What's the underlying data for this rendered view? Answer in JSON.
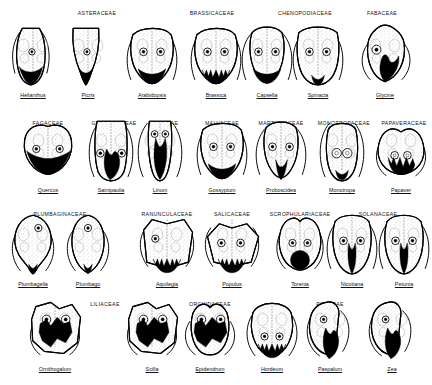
{
  "figure": {
    "ink_color": "#000000",
    "background": "#ffffff",
    "stipple_color": "#9a9a9a",
    "rows": [
      {
        "id": "row-1",
        "families": [
          {
            "name": "ASTERACEAE",
            "cx": 97,
            "y": 10
          },
          {
            "name": "BRASSICACEAE",
            "cx": 212,
            "y": 10
          },
          {
            "name": "CHENOPODIACEAE",
            "cx": 305,
            "y": 10
          },
          {
            "name": "FABACEAE",
            "cx": 382,
            "y": 10
          }
        ],
        "taxa": [
          {
            "genus": "Helianthus",
            "cx": 33,
            "label_y": 92,
            "shape": "slender-erect",
            "embryo": "basal-wedge"
          },
          {
            "genus": "Picris",
            "cx": 88,
            "label_y": 92,
            "shape": "slender-v",
            "embryo": "basal-narrow"
          },
          {
            "genus": "Arabidopsis",
            "cx": 152,
            "label_y": 92,
            "shape": "broad-lobed",
            "embryo": "basal-broad"
          },
          {
            "genus": "Brassica",
            "cx": 216,
            "label_y": 92,
            "shape": "broad-lobed",
            "embryo": "basal-fringe"
          },
          {
            "genus": "Capsella",
            "cx": 267,
            "label_y": 92,
            "shape": "narrow-lobed",
            "embryo": "basal-broad"
          },
          {
            "genus": "Spinacia",
            "cx": 318,
            "label_y": 92,
            "shape": "broad-square",
            "embryo": "basal-small"
          },
          {
            "genus": "Glycine",
            "cx": 385,
            "label_y": 92,
            "shape": "rounded-ovate",
            "embryo": "basal-lobe"
          }
        ]
      },
      {
        "id": "row-2",
        "families": [
          {
            "name": "FAGACEAE",
            "cx": 48,
            "y": 120
          },
          {
            "name": "GESNERIACEAE",
            "cx": 114,
            "y": 120
          },
          {
            "name": "LINACEAE",
            "cx": 164,
            "y": 120
          },
          {
            "name": "MALVACEAE",
            "cx": 222,
            "y": 120
          },
          {
            "name": "MARTYNIACEAE",
            "cx": 281,
            "y": 120
          },
          {
            "name": "MONOTROPACEAE",
            "cx": 344,
            "y": 120
          },
          {
            "name": "PAPAVERACEAE",
            "cx": 404,
            "y": 120
          }
        ],
        "taxa": [
          {
            "genus": "Quercus",
            "cx": 48,
            "label_y": 187,
            "shape": "wide-heart",
            "embryo": "basal-wide"
          },
          {
            "genus": "Saintpaulia",
            "cx": 111,
            "label_y": 187,
            "shape": "tall-column",
            "embryo": "lateral-mass"
          },
          {
            "genus": "Linum",
            "cx": 160,
            "label_y": 187,
            "shape": "tall-narrow",
            "embryo": "axial-long"
          },
          {
            "genus": "Gossypium",
            "cx": 222,
            "label_y": 187,
            "shape": "broad-lobed",
            "embryo": "basal-broad"
          },
          {
            "genus": "Proboscidea",
            "cx": 281,
            "label_y": 187,
            "shape": "narrow-lobed",
            "embryo": "basal-spike"
          },
          {
            "genus": "Monotropa",
            "cx": 342,
            "label_y": 187,
            "shape": "tall-oval",
            "embryo": "basal-small"
          },
          {
            "genus": "Papaver",
            "cx": 401,
            "label_y": 187,
            "shape": "lobed-broad",
            "embryo": "basal-ragged"
          }
        ]
      },
      {
        "id": "row-3",
        "families": [
          {
            "name": "PLUMBAGINACEAE",
            "cx": 60,
            "y": 211
          },
          {
            "name": "RANUNCULACEAE",
            "cx": 167,
            "y": 211
          },
          {
            "name": "SALICACEAE",
            "cx": 232,
            "y": 211
          },
          {
            "name": "SCROPHULARIACEAE",
            "cx": 300,
            "y": 211
          },
          {
            "name": "SOLANACEAE",
            "cx": 378,
            "y": 211
          }
        ],
        "taxa": [
          {
            "genus": "Plumbagella",
            "cx": 33,
            "label_y": 281,
            "shape": "pear-drop",
            "embryo": "basal-tip"
          },
          {
            "genus": "Plumbago",
            "cx": 88,
            "label_y": 281,
            "shape": "oval-upright",
            "embryo": "basal-tip"
          },
          {
            "genus": "Aquilegia",
            "cx": 167,
            "label_y": 281,
            "shape": "angular-wide",
            "embryo": "basal-fringe"
          },
          {
            "genus": "Populus",
            "cx": 232,
            "label_y": 281,
            "shape": "flat-wide",
            "embryo": "basal-fringe"
          },
          {
            "genus": "Torenia",
            "cx": 300,
            "label_y": 281,
            "shape": "round-lobed",
            "embryo": "basal-disc"
          },
          {
            "genus": "Nicotiana",
            "cx": 352,
            "label_y": 281,
            "shape": "tall-lobed",
            "embryo": "axial-spike"
          },
          {
            "genus": "Petunia",
            "cx": 404,
            "label_y": 281,
            "shape": "tall-lobed",
            "embryo": "axial-spike"
          }
        ]
      },
      {
        "id": "row-4",
        "families": [
          {
            "name": "LILIACEAE",
            "cx": 105,
            "y": 301
          },
          {
            "name": "ORCHIDACEAE",
            "cx": 210,
            "y": 301
          },
          {
            "name": "POACEAE",
            "cx": 330,
            "y": 301
          }
        ],
        "taxa": [
          {
            "genus": "Ornithogalum",
            "cx": 55,
            "label_y": 366,
            "shape": "blocky-lobed",
            "embryo": "central-mass"
          },
          {
            "genus": "Scilla",
            "cx": 152,
            "label_y": 366,
            "shape": "blocky-lobed",
            "embryo": "central-mass"
          },
          {
            "genus": "Epidendrum",
            "cx": 210,
            "label_y": 366,
            "shape": "small-lobed",
            "embryo": "central-mass"
          },
          {
            "genus": "Hordeum",
            "cx": 272,
            "label_y": 366,
            "shape": "broad-oval",
            "embryo": "basal-fringe"
          },
          {
            "genus": "Paspalum",
            "cx": 330,
            "label_y": 366,
            "shape": "oblique-pair",
            "embryo": "lateral-mass"
          },
          {
            "genus": "Zea",
            "cx": 392,
            "label_y": 366,
            "shape": "oblique-pair",
            "embryo": "lateral-mass"
          }
        ]
      }
    ]
  }
}
